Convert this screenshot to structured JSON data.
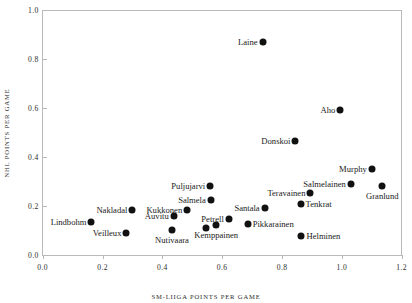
{
  "chart_data": {
    "type": "scatter",
    "title": "",
    "xlabel": "SM-LIIGA POINTS PER GAME",
    "ylabel": "NHL POINTS PER GAME",
    "xlim": [
      0.0,
      1.2
    ],
    "ylim": [
      0.0,
      1.0
    ],
    "xticks": [
      "0.0",
      "0.2",
      "0.4",
      "0.6",
      "0.8",
      "1.0",
      "1.2"
    ],
    "yticks": [
      "0.0",
      "0.2",
      "0.4",
      "0.6",
      "0.8",
      "1.0"
    ],
    "grid": false,
    "legend": "none",
    "marker_color": "#111111",
    "axis_color": "#b9b9b9",
    "points": [
      {
        "name": "Laine",
        "x": 0.735,
        "y": 0.87,
        "label_pos": "left"
      },
      {
        "name": "Aho",
        "x": 0.995,
        "y": 0.592,
        "label_pos": "left"
      },
      {
        "name": "Donskoi",
        "x": 0.845,
        "y": 0.465,
        "label_pos": "left"
      },
      {
        "name": "Murphy",
        "x": 1.1,
        "y": 0.353,
        "label_pos": "left"
      },
      {
        "name": "Salmelainen",
        "x": 1.03,
        "y": 0.288,
        "label_pos": "left"
      },
      {
        "name": "Granlund",
        "x": 1.135,
        "y": 0.282,
        "label_pos": "below"
      },
      {
        "name": "Puljujarvi",
        "x": 0.56,
        "y": 0.282,
        "label_pos": "left"
      },
      {
        "name": "Teravainen",
        "x": 0.895,
        "y": 0.255,
        "label_pos": "left"
      },
      {
        "name": "Salmela",
        "x": 0.562,
        "y": 0.224,
        "label_pos": "left"
      },
      {
        "name": "Tenkrat",
        "x": 0.862,
        "y": 0.208,
        "label_pos": "right"
      },
      {
        "name": "Santala",
        "x": 0.742,
        "y": 0.192,
        "label_pos": "left"
      },
      {
        "name": "Nakladal",
        "x": 0.3,
        "y": 0.183,
        "label_pos": "left"
      },
      {
        "name": "Kukkonen",
        "x": 0.483,
        "y": 0.183,
        "label_pos": "left"
      },
      {
        "name": "Auvitu",
        "x": 0.438,
        "y": 0.16,
        "label_pos": "left"
      },
      {
        "name": "Petrell",
        "x": 0.622,
        "y": 0.147,
        "label_pos": "left"
      },
      {
        "name": "Lindbohm",
        "x": 0.163,
        "y": 0.133,
        "label_pos": "left"
      },
      {
        "name": "Pikkarainen",
        "x": 0.685,
        "y": 0.127,
        "label_pos": "right"
      },
      {
        "name": "Kemppainen",
        "x": 0.58,
        "y": 0.122,
        "label_pos": "below"
      },
      {
        "name": "Nutivaara",
        "x": 0.432,
        "y": 0.102,
        "label_pos": "below"
      },
      {
        "name": "Veilleux",
        "x": 0.28,
        "y": 0.088,
        "label_pos": "left"
      },
      {
        "name": "Helminen",
        "x": 0.865,
        "y": 0.077,
        "label_pos": "right"
      },
      {
        "name": "Petrell2",
        "x": 0.545,
        "y": 0.11,
        "label_pos": "none"
      }
    ]
  }
}
